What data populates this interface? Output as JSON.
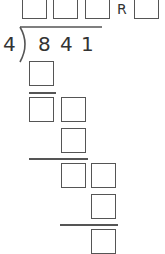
{
  "problem": {
    "divisor": "4",
    "dividend_digits": [
      "8",
      "4",
      "1"
    ],
    "remainder_label": "R"
  },
  "colors": {
    "stroke": "#555555",
    "text": "#333333",
    "background": "#ffffff"
  }
}
